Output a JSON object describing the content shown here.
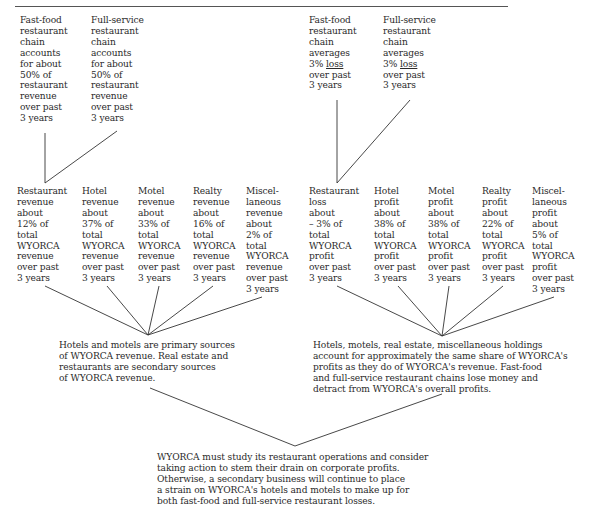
{
  "top_left": [
    {
      "text": "Fast-food\nrestaurant\nchain\naccounts\nfor about\n50% of\nrestaurant\nrevenue\nover past\n3 years"
    },
    {
      "text": "Full-service\nrestaurant\nchain\naccounts\nfor about\n50% of\nrestaurant\nrevenue\nover past\n3 years"
    }
  ],
  "top_right": [
    {
      "line1": "Fast-food\nrestaurant\nchain\naverages\n3% ",
      "underlined": "loss",
      "line2": "\nover past\n3 years"
    },
    {
      "line1": "Full-service\nrestaurant\nchain\naverages\n3% ",
      "underlined": "loss",
      "line2": "\nover past\n3 years"
    }
  ],
  "revenue_row": [
    {
      "text": "Restaurant\nrevenue\nabout\n12% of\ntotal\nWYORCA\nrevenue\nover past\n3 years"
    },
    {
      "text": "Hotel\nrevenue\nabout\n37% of\ntotal\nWYORCA\nrevenue\nover past\n3 years"
    },
    {
      "text": "Motel\nrevenue\nabout\n33% of\ntotal\nWYORCA\nrevenue\nover past\n3 years"
    },
    {
      "text": "Realty\nrevenue\nabout\n16% of\ntotal\nWYORCA\nrevenue\nover past\n3 years"
    },
    {
      "text": "Miscel-\nlaneous\nrevenue\nabout\n2% of\ntotal\nWYORCA\nrevenue\nover past\n3 years"
    }
  ],
  "profit_row": [
    {
      "text": "Restaurant\nloss\nabout\n– 3% of\ntotal\nWYORCA\nprofit\nover past\n3 years"
    },
    {
      "text": "Hotel\nprofit\nabout\n38% of\ntotal\nWYORCA\nprofit\nover past\n3 years"
    },
    {
      "text": "Motel\nprofit\nabout\n38% of\ntotal\nWYORCA\nprofit\nover past\n3 years"
    },
    {
      "text": "Realty\nprofit\nabout\n22% of\ntotal\nWYORCA\nprofit\nover past\n3 years"
    },
    {
      "text": "Miscel-\nlaneous\nprofit\nabout\n5% of\ntotal\nWYORCA\nprofit\nover past\n3 years"
    }
  ],
  "revenue_conclusion": "Hotels and motels are primary sources\nof WYORCA revenue. Real estate and\nrestaurants are secondary sources\nof WYORCA revenue.",
  "profit_conclusion": "Hotels, motels, real estate, miscellaneous holdings\naccount for approximately the same share of WYORCA's\nprofits as they do of WYORCA's revenue. Fast-food\nand full-service restaurant chains lose money and\ndetract from WYORCA's overall profits.",
  "final_conclusion": "WYORCA must study its restaurant operations and consider\ntaking action to stem their drain on corporate profits.\nOtherwise, a secondary business will continue to place\na strain on WYORCA's hotels and motels to make up for\nboth fast-food and full-service restaurant losses.",
  "colors": {
    "text": "#2a2a2a",
    "lines": "#333333",
    "background": "#ffffff"
  }
}
